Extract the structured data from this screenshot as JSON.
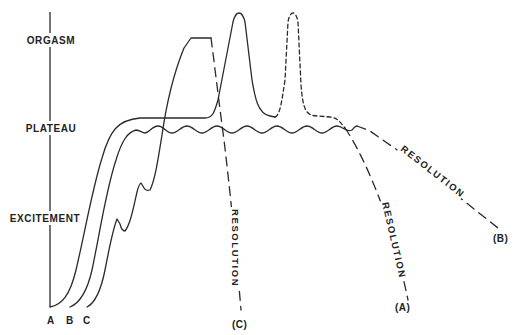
{
  "diagram": {
    "type": "sexual-response-cycle",
    "style": {
      "ink": "#2a2a2a",
      "background": "#ffffff"
    },
    "axis": {
      "phases": [
        "ORGASM",
        "PLATEAU",
        "EXCITEMENT"
      ]
    },
    "phase_labels": {
      "orgasm": "ORGASM",
      "plateau": "PLATEAU",
      "excitement": "EXCITEMENT"
    },
    "pattern_labels": {
      "a": "A",
      "b": "B",
      "c": "C"
    },
    "resolution_labels": {
      "a": "RESOLUTION",
      "b": "RESOLUTION",
      "c": "RESOLUTION"
    },
    "endpoint_labels": {
      "a": "(A)",
      "b": "(B)",
      "c": "(C)"
    },
    "curves": [
      {
        "id": "A",
        "description": "Rise through excitement to plateau, one orgasm peak (solid) with optional second orgasm peak (dotted), long-dash resolution to (A)"
      },
      {
        "id": "B",
        "description": "Rise to wavy sustained plateau, no orgasm, slow dashed resolution to (B)"
      },
      {
        "id": "C",
        "description": "Stepped excitement rise, rapid climb to sustained orgasm, steep dashed resolution to (C)"
      }
    ]
  }
}
